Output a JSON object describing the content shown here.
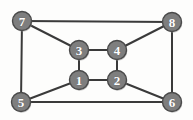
{
  "figure": {
    "background_color": "#fdfdfc",
    "width": 193,
    "height": 120
  },
  "style": {
    "node_fill": "#7e7e7e",
    "node_stroke": "#4a4a4a",
    "node_radius": 9.5,
    "label_color": "#ffffff",
    "edge_color": "#3a3a3a",
    "edge_width": 2
  },
  "graph_data": {
    "type": "graph",
    "directed": false,
    "node_count": 8,
    "edge_count": 12,
    "nodes": [
      {
        "id": "1",
        "label": "1",
        "x": 79,
        "y": 80
      },
      {
        "id": "2",
        "label": "2",
        "x": 117,
        "y": 80
      },
      {
        "id": "3",
        "label": "3",
        "x": 79,
        "y": 50
      },
      {
        "id": "4",
        "label": "4",
        "x": 117,
        "y": 50
      },
      {
        "id": "5",
        "label": "5",
        "x": 21,
        "y": 102
      },
      {
        "id": "6",
        "label": "6",
        "x": 172,
        "y": 102
      },
      {
        "id": "7",
        "label": "7",
        "x": 22,
        "y": 21
      },
      {
        "id": "8",
        "label": "8",
        "x": 172,
        "y": 22
      }
    ],
    "edges": [
      {
        "source": "1",
        "target": "2"
      },
      {
        "source": "1",
        "target": "3"
      },
      {
        "source": "2",
        "target": "4"
      },
      {
        "source": "3",
        "target": "4"
      },
      {
        "source": "1",
        "target": "5"
      },
      {
        "source": "2",
        "target": "6"
      },
      {
        "source": "3",
        "target": "7"
      },
      {
        "source": "4",
        "target": "8"
      },
      {
        "source": "5",
        "target": "6"
      },
      {
        "source": "5",
        "target": "7"
      },
      {
        "source": "6",
        "target": "8"
      },
      {
        "source": "7",
        "target": "8"
      }
    ]
  }
}
